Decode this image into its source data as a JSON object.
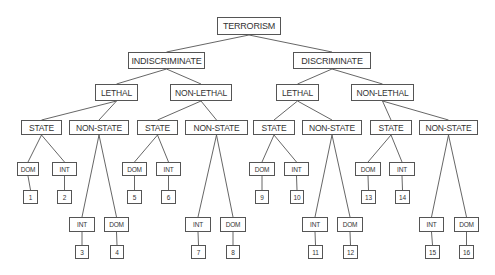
{
  "diagram": {
    "type": "tree",
    "title": "TERRORISM",
    "nodes": [
      {
        "id": "root",
        "label": "TERRORISM",
        "level": 0,
        "x": 217,
        "y": 17,
        "w": 64,
        "h": 18
      },
      {
        "id": "indisc",
        "label": "INDISCRIMINATE",
        "level": 1,
        "x": 128,
        "y": 52,
        "w": 77,
        "h": 17,
        "parent": "root"
      },
      {
        "id": "disc",
        "label": "DISCRIMINATE",
        "level": 1,
        "x": 293,
        "y": 52,
        "w": 78,
        "h": 17,
        "parent": "root"
      },
      {
        "id": "i_leth",
        "label": "LETHAL",
        "level": 2,
        "x": 95,
        "y": 84,
        "w": 43,
        "h": 17,
        "parent": "indisc"
      },
      {
        "id": "i_nonleth",
        "label": "NON-LETHAL",
        "level": 2,
        "x": 170,
        "y": 84,
        "w": 62,
        "h": 17,
        "parent": "indisc"
      },
      {
        "id": "d_leth",
        "label": "LETHAL",
        "level": 2,
        "x": 276,
        "y": 84,
        "w": 43,
        "h": 17,
        "parent": "disc"
      },
      {
        "id": "d_nonleth",
        "label": "NON-LETHAL",
        "level": 2,
        "x": 351,
        "y": 84,
        "w": 63,
        "h": 17,
        "parent": "disc"
      },
      {
        "id": "s1",
        "label": "STATE",
        "level": 3,
        "x": 21,
        "y": 120,
        "w": 41,
        "h": 15,
        "parent": "i_leth"
      },
      {
        "id": "ns1",
        "label": "NON-STATE",
        "level": 3,
        "x": 69,
        "y": 120,
        "w": 60,
        "h": 15,
        "parent": "i_leth"
      },
      {
        "id": "s2",
        "label": "STATE",
        "level": 3,
        "x": 137,
        "y": 120,
        "w": 41,
        "h": 15,
        "parent": "i_nonleth"
      },
      {
        "id": "ns2",
        "label": "NON-STATE",
        "level": 3,
        "x": 185,
        "y": 120,
        "w": 63,
        "h": 15,
        "parent": "i_nonleth"
      },
      {
        "id": "s3",
        "label": "STATE",
        "level": 3,
        "x": 253,
        "y": 120,
        "w": 42,
        "h": 15,
        "parent": "d_leth"
      },
      {
        "id": "ns3",
        "label": "NON-STATE",
        "level": 3,
        "x": 302,
        "y": 120,
        "w": 60,
        "h": 15,
        "parent": "d_leth"
      },
      {
        "id": "s4",
        "label": "STATE",
        "level": 3,
        "x": 370,
        "y": 120,
        "w": 42,
        "h": 15,
        "parent": "d_nonleth"
      },
      {
        "id": "ns4",
        "label": "NON-STATE",
        "level": 3,
        "x": 419,
        "y": 120,
        "w": 59,
        "h": 15,
        "parent": "d_nonleth"
      },
      {
        "id": "c1",
        "label": "DOM",
        "level": 4,
        "x": 17,
        "y": 162,
        "w": 22,
        "h": 14,
        "parent": "s1"
      },
      {
        "id": "c2",
        "label": "INT",
        "level": 4,
        "x": 52,
        "y": 162,
        "w": 25,
        "h": 14,
        "parent": "s1"
      },
      {
        "id": "c3",
        "label": "INT",
        "level": 4,
        "x": 69,
        "y": 217,
        "w": 26,
        "h": 15,
        "parent": "ns1"
      },
      {
        "id": "c4",
        "label": "DOM",
        "level": 4,
        "x": 104,
        "y": 217,
        "w": 25,
        "h": 15,
        "parent": "ns1"
      },
      {
        "id": "c5",
        "label": "DOM",
        "level": 4,
        "x": 122,
        "y": 162,
        "w": 25,
        "h": 14,
        "parent": "s2"
      },
      {
        "id": "c6",
        "label": "INT",
        "level": 4,
        "x": 156,
        "y": 162,
        "w": 25,
        "h": 14,
        "parent": "s2"
      },
      {
        "id": "c7",
        "label": "INT",
        "level": 4,
        "x": 185,
        "y": 217,
        "w": 26,
        "h": 15,
        "parent": "ns2"
      },
      {
        "id": "c8",
        "label": "DOM",
        "level": 4,
        "x": 220,
        "y": 217,
        "w": 26,
        "h": 15,
        "parent": "ns2"
      },
      {
        "id": "c9",
        "label": "DOM",
        "level": 4,
        "x": 249,
        "y": 162,
        "w": 26,
        "h": 14,
        "parent": "s3"
      },
      {
        "id": "c10",
        "label": "INT",
        "level": 4,
        "x": 284,
        "y": 162,
        "w": 25,
        "h": 14,
        "parent": "s3"
      },
      {
        "id": "c11",
        "label": "INT",
        "level": 4,
        "x": 302,
        "y": 217,
        "w": 26,
        "h": 15,
        "parent": "ns3"
      },
      {
        "id": "c12",
        "label": "DOM",
        "level": 4,
        "x": 337,
        "y": 217,
        "w": 26,
        "h": 15,
        "parent": "ns3"
      },
      {
        "id": "c13",
        "label": "DOM",
        "level": 4,
        "x": 355,
        "y": 162,
        "w": 26,
        "h": 14,
        "parent": "s4"
      },
      {
        "id": "c14",
        "label": "INT",
        "level": 4,
        "x": 389,
        "y": 162,
        "w": 26,
        "h": 14,
        "parent": "s4"
      },
      {
        "id": "c15",
        "label": "INT",
        "level": 4,
        "x": 419,
        "y": 217,
        "w": 25,
        "h": 15,
        "parent": "ns4"
      },
      {
        "id": "c16",
        "label": "DOM",
        "level": 4,
        "x": 454,
        "y": 217,
        "w": 25,
        "h": 15,
        "parent": "ns4"
      },
      {
        "id": "n1",
        "label": "1",
        "level": 5,
        "x": 23,
        "y": 190,
        "w": 15,
        "h": 14,
        "parent": "c1"
      },
      {
        "id": "n2",
        "label": "2",
        "level": 5,
        "x": 57,
        "y": 190,
        "w": 15,
        "h": 14,
        "parent": "c2"
      },
      {
        "id": "n3",
        "label": "3",
        "level": 5,
        "x": 75,
        "y": 245,
        "w": 14,
        "h": 14,
        "parent": "c3"
      },
      {
        "id": "n4",
        "label": "4",
        "level": 5,
        "x": 110,
        "y": 245,
        "w": 14,
        "h": 14,
        "parent": "c4"
      },
      {
        "id": "n5",
        "label": "5",
        "level": 5,
        "x": 127,
        "y": 190,
        "w": 15,
        "h": 14,
        "parent": "c5"
      },
      {
        "id": "n6",
        "label": "6",
        "level": 5,
        "x": 161,
        "y": 190,
        "w": 15,
        "h": 14,
        "parent": "c6"
      },
      {
        "id": "n7",
        "label": "7",
        "level": 5,
        "x": 191,
        "y": 245,
        "w": 15,
        "h": 14,
        "parent": "c7"
      },
      {
        "id": "n8",
        "label": "8",
        "level": 5,
        "x": 226,
        "y": 245,
        "w": 14,
        "h": 14,
        "parent": "c8"
      },
      {
        "id": "n9",
        "label": "9",
        "level": 5,
        "x": 255,
        "y": 190,
        "w": 14,
        "h": 14,
        "parent": "c9"
      },
      {
        "id": "n10",
        "label": "10",
        "level": 5,
        "x": 290,
        "y": 190,
        "w": 14,
        "h": 14,
        "parent": "c10"
      },
      {
        "id": "n11",
        "label": "11",
        "level": 5,
        "x": 308,
        "y": 245,
        "w": 15,
        "h": 14,
        "parent": "c11"
      },
      {
        "id": "n12",
        "label": "12",
        "level": 5,
        "x": 343,
        "y": 245,
        "w": 15,
        "h": 14,
        "parent": "c12"
      },
      {
        "id": "n13",
        "label": "13",
        "level": 5,
        "x": 361,
        "y": 190,
        "w": 15,
        "h": 14,
        "parent": "c13"
      },
      {
        "id": "n14",
        "label": "14",
        "level": 5,
        "x": 395,
        "y": 190,
        "w": 15,
        "h": 14,
        "parent": "c14"
      },
      {
        "id": "n15",
        "label": "15",
        "level": 5,
        "x": 425,
        "y": 245,
        "w": 15,
        "h": 14,
        "parent": "c15"
      },
      {
        "id": "n16",
        "label": "16",
        "level": 5,
        "x": 459,
        "y": 245,
        "w": 15,
        "h": 14,
        "parent": "c16"
      }
    ],
    "colors": {
      "border": "#555555",
      "text": "#333333",
      "background": "#ffffff"
    }
  }
}
